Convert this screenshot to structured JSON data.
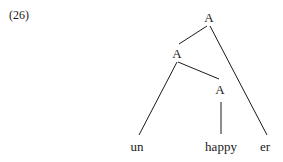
{
  "example": {
    "number": "(26)"
  },
  "tree": {
    "root": {
      "label": "A"
    },
    "inner": {
      "label": "A"
    },
    "lower": {
      "label": "A"
    },
    "leaves": [
      {
        "label": "un"
      },
      {
        "label": "happy"
      },
      {
        "label": "er"
      }
    ]
  }
}
